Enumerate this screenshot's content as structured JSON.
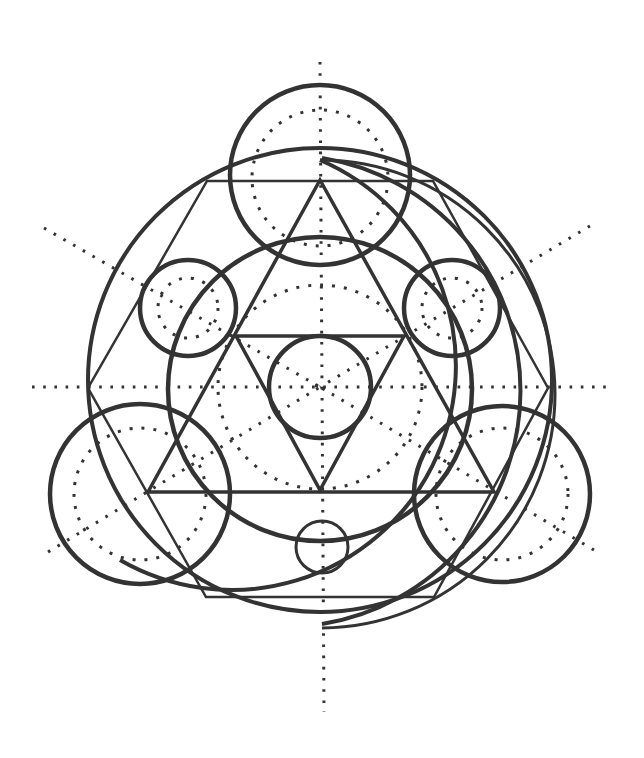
{
  "diagram": {
    "type": "geometric-construction",
    "colors": {
      "background": "#ffffff",
      "stroke": "#333333"
    },
    "center": [
      320,
      385
    ],
    "axes": {
      "vertical": {
        "x1": 320,
        "y1": 62,
        "x2": 324,
        "y2": 712
      },
      "horizontal": {
        "x1": 32,
        "y1": 387,
        "x2": 608,
        "y2": 387
      },
      "diag_upper_left": {
        "x1": 44,
        "y1": 228,
        "x2": 320,
        "y2": 387
      },
      "diag_upper_right": {
        "x1": 590,
        "y1": 226,
        "x2": 320,
        "y2": 387
      },
      "diag_lower_left": {
        "x1": 48,
        "y1": 552,
        "x2": 320,
        "y2": 387
      },
      "diag_lower_right": {
        "x1": 594,
        "y1": 550,
        "x2": 320,
        "y2": 387
      }
    },
    "solid_circles": [
      {
        "name": "top-circle",
        "cx": 320,
        "cy": 175,
        "r": 90
      },
      {
        "name": "upper-left-circle",
        "cx": 188,
        "cy": 308,
        "r": 48
      },
      {
        "name": "upper-right-circle",
        "cx": 452,
        "cy": 308,
        "r": 48
      },
      {
        "name": "center-circle",
        "cx": 320,
        "cy": 387,
        "r": 51
      },
      {
        "name": "middle-ring",
        "cx": 320,
        "cy": 389,
        "r": 152
      },
      {
        "name": "lower-left-circle",
        "cx": 140,
        "cy": 494,
        "r": 90
      },
      {
        "name": "lower-right-circle",
        "cx": 502,
        "cy": 494,
        "r": 88
      },
      {
        "name": "bottom-small-circle",
        "cx": 322,
        "cy": 547,
        "r": 26
      }
    ],
    "dotted_circles": [
      {
        "name": "top-dotted",
        "cx": 320,
        "cy": 178,
        "r": 68
      },
      {
        "name": "upper-left-dotted",
        "cx": 188,
        "cy": 308,
        "r": 30
      },
      {
        "name": "upper-right-dotted",
        "cx": 452,
        "cy": 308,
        "r": 30
      },
      {
        "name": "center-dotted",
        "cx": 320,
        "cy": 387,
        "r": 102
      },
      {
        "name": "lower-left-dotted",
        "cx": 140,
        "cy": 494,
        "r": 66
      },
      {
        "name": "lower-right-dotted",
        "cx": 502,
        "cy": 494,
        "r": 66
      }
    ],
    "large_arcs": [
      {
        "name": "outer-circle",
        "cx": 320,
        "cy": 380,
        "r": 232
      },
      {
        "name": "offset-arc-1",
        "d": "M 320 160 A 224 224 0 1 1 120 560"
      },
      {
        "name": "offset-arc-2",
        "d": "M 322 628 A 228 228 0 0 0 320 160"
      },
      {
        "name": "offset-arc-3",
        "d": "M 322 158 A 236 236 0 0 1 322 624"
      }
    ],
    "polygons": {
      "upward_triangle": "320,180 148,492 494,492",
      "downward_triangle": "236,336 404,336 320,490",
      "outer_hexagon": "207,181 433,181 548,388 434,597 206,597 88,388"
    },
    "labels": []
  }
}
